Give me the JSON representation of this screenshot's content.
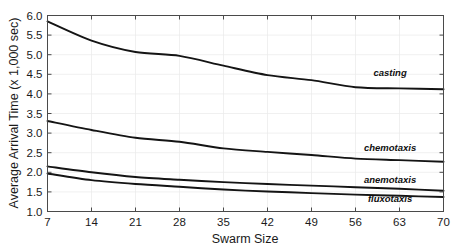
{
  "chart_data": {
    "type": "line",
    "title": "",
    "xlabel": "Swarm Size",
    "ylabel": "Average Arrival Time (x 1,000 sec)",
    "xlim": [
      7,
      70
    ],
    "ylim": [
      1.0,
      6.0
    ],
    "grid": true,
    "legend_position": "inline-right",
    "x": [
      7,
      14,
      21,
      28,
      35,
      42,
      49,
      56,
      63,
      70
    ],
    "xticks": [
      "7",
      "14",
      "21",
      "28",
      "35",
      "42",
      "49",
      "56",
      "63",
      "70"
    ],
    "yticks": [
      "1.0",
      "1.5",
      "2.0",
      "2.5",
      "3.0",
      "3.5",
      "4.0",
      "4.5",
      "5.0",
      "5.5",
      "6.0"
    ],
    "series": [
      {
        "name": "casting",
        "values": [
          5.85,
          5.36,
          5.07,
          4.97,
          4.72,
          4.48,
          4.35,
          4.17,
          4.14,
          4.12
        ],
        "label_x": 61.5,
        "label_y": 4.45
      },
      {
        "name": "chemotaxis",
        "values": [
          3.31,
          3.08,
          2.88,
          2.78,
          2.61,
          2.52,
          2.44,
          2.35,
          2.31,
          2.27
        ],
        "label_x": 61.5,
        "label_y": 2.55
      },
      {
        "name": "anemotaxis",
        "values": [
          2.15,
          2.0,
          1.88,
          1.81,
          1.75,
          1.7,
          1.66,
          1.62,
          1.58,
          1.53
        ],
        "label_x": 61.5,
        "label_y": 1.73
      },
      {
        "name": "fluxotaxis",
        "values": [
          1.97,
          1.8,
          1.7,
          1.63,
          1.56,
          1.51,
          1.47,
          1.43,
          1.4,
          1.37
        ],
        "label_x": 61.5,
        "label_y": 1.24
      }
    ]
  },
  "colors": {
    "line": "#141414",
    "axis": "#4a4a4a",
    "grid": "#e9e9e9",
    "background": "#ffffff",
    "text": "#1a1a1a"
  }
}
